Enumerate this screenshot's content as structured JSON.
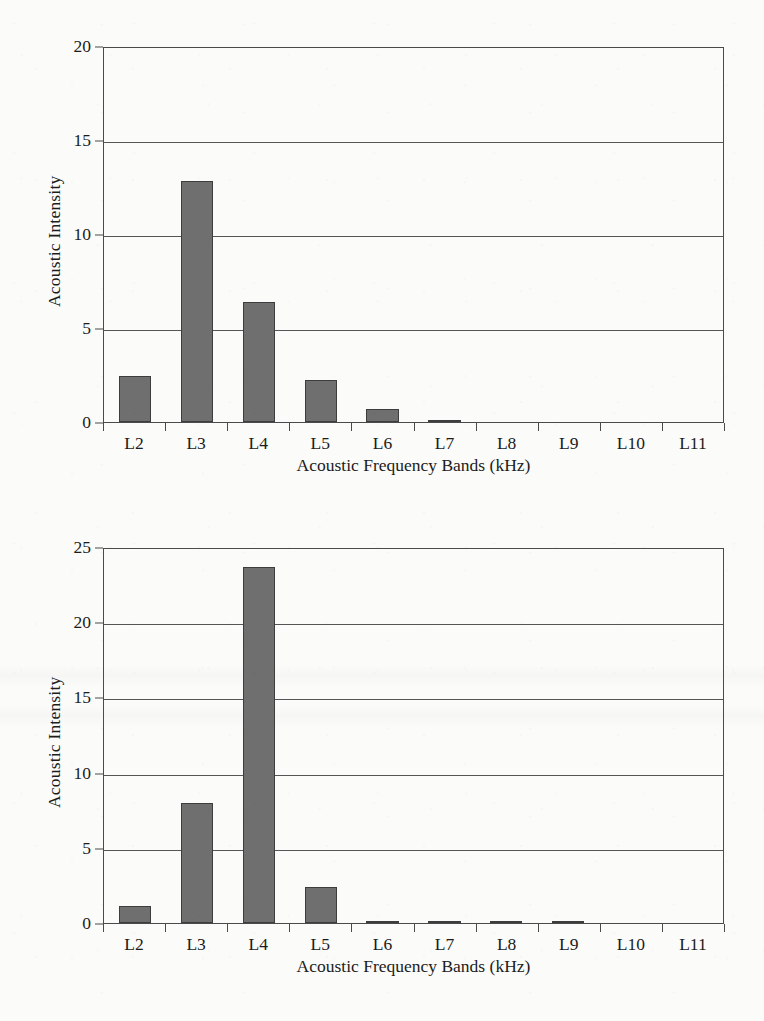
{
  "chart_data": [
    {
      "id": "top",
      "type": "bar",
      "title": "",
      "xlabel": "Acoustic Frequency Bands (kHz)",
      "ylabel": "Acoustic Intensity",
      "categories": [
        "L2",
        "L3",
        "L4",
        "L5",
        "L6",
        "L7",
        "L8",
        "L9",
        "L10",
        "L11"
      ],
      "values": [
        2.45,
        12.8,
        6.4,
        2.25,
        0.7,
        0.12,
        0,
        0,
        0,
        0
      ],
      "ylim": [
        0,
        20
      ],
      "yticks": [
        0,
        5,
        10,
        15,
        20
      ],
      "ytick_labels": [
        "0",
        "5",
        "10",
        "15",
        "20"
      ],
      "grid": true,
      "legend": "none",
      "bar_color": "#6f6f6f",
      "bar_edge_color": "#3d3d3d",
      "axis_color": "#4a4a4a"
    },
    {
      "id": "bottom",
      "type": "bar",
      "title": "",
      "xlabel": "Acoustic Frequency Bands (kHz)",
      "ylabel": "Acoustic Intensity",
      "categories": [
        "L2",
        "L3",
        "L4",
        "L5",
        "L6",
        "L7",
        "L8",
        "L9",
        "L10",
        "L11"
      ],
      "values": [
        1.1,
        8.0,
        23.7,
        2.4,
        0.15,
        0.1,
        0.12,
        0.1,
        0,
        0
      ],
      "ylim": [
        0,
        25
      ],
      "yticks": [
        0,
        5,
        10,
        15,
        20,
        25
      ],
      "ytick_labels": [
        "0",
        "5",
        "10",
        "15",
        "20",
        "25"
      ],
      "grid": true,
      "legend": "none",
      "bar_color": "#6f6f6f",
      "bar_edge_color": "#3d3d3d",
      "axis_color": "#4a4a4a"
    }
  ]
}
